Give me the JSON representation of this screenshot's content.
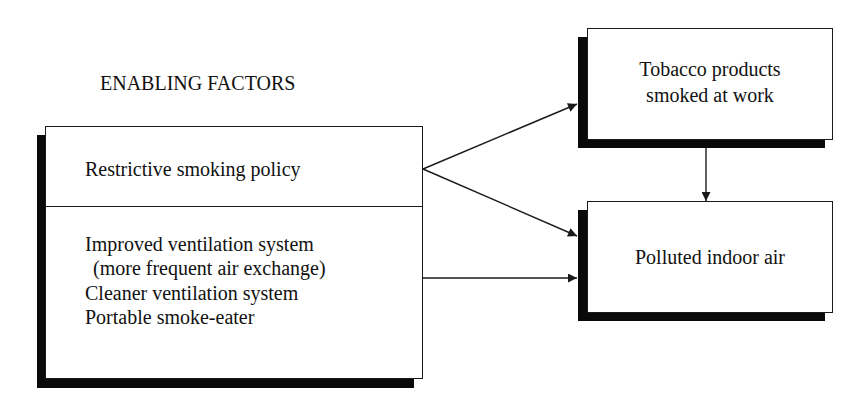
{
  "diagram": {
    "section_title": "ENABLING FACTORS",
    "enabling_box": {
      "top_item": "Restrictive smoking policy",
      "bottom_items": [
        "Improved ventilation system",
        " (more frequent air exchange)",
        "Cleaner ventilation system",
        "Portable smoke-eater"
      ]
    },
    "tobacco_box": {
      "line1": "Tobacco products",
      "line2": "smoked at work"
    },
    "polluted_box": {
      "label": "Polluted indoor air"
    },
    "edges": [
      {
        "from": "Restrictive smoking policy",
        "to": "Tobacco products smoked at work"
      },
      {
        "from": "Restrictive smoking policy",
        "to": "Polluted indoor air"
      },
      {
        "from": "Ventilation / smoke-eater factors",
        "to": "Polluted indoor air"
      },
      {
        "from": "Tobacco products smoked at work",
        "to": "Polluted indoor air"
      }
    ],
    "colors": {
      "line": "#1a1a1a",
      "shadow": "#0a0a0a",
      "background": "#ffffff"
    }
  }
}
